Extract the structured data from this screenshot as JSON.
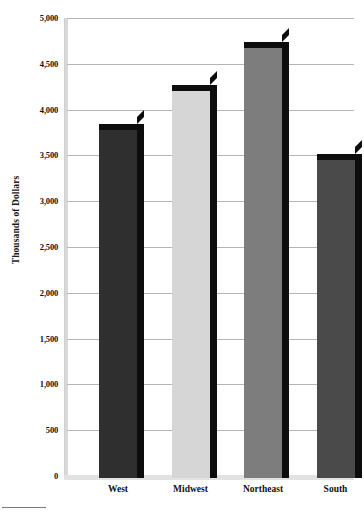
{
  "chart_data": {
    "type": "bar",
    "title": "",
    "subtitle": "",
    "xlabel": "",
    "ylabel": "Thousands of Dollars",
    "categories": [
      "West",
      "Midwest",
      "Northeast",
      "South"
    ],
    "values": [
      3860,
      4290,
      4760,
      3540
    ],
    "series": [
      {
        "name": "Thousands of Dollars",
        "values": [
          3860,
          4290,
          4760,
          3540
        ]
      }
    ],
    "bar_colors": [
      "#2f2f2f",
      "#d6d6d6",
      "#7d7d7d",
      "#4a4a4a"
    ],
    "bar_shadow_color": "#0d0d0d",
    "ylim": [
      0,
      5000
    ],
    "ytick_step": 500,
    "ytick_labels": [
      "5,000",
      "4,500",
      "4,000",
      "3,500",
      "3,000",
      "2,500",
      "2,000",
      "1,500",
      "1,000",
      "500",
      "0"
    ],
    "ytick_values": [
      5000,
      4500,
      4000,
      3500,
      3000,
      2500,
      2000,
      1500,
      1000,
      500,
      0
    ],
    "grid": true,
    "grid_color": "#b5b5b5",
    "legend": "none",
    "axis_color": "#d9d9d9",
    "baseline_color": "#e2e2e2",
    "background": "#ffffff",
    "style": "3d-column-grayscale"
  },
  "figure": {
    "footer_rule": ""
  }
}
